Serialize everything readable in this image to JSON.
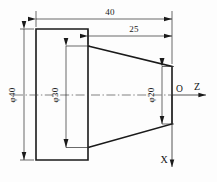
{
  "drawing": {
    "title": "Truncated cone on cylinder - engineering drawing",
    "background_color": "#fdfdfd",
    "line_color": "#1a1a1a",
    "dimensions": {
      "overall_length": {
        "value": "40",
        "name": "overall-length",
        "orientation": "horizontal"
      },
      "cone_length": {
        "value": "25",
        "name": "cone-length",
        "orientation": "horizontal"
      },
      "large_diameter": {
        "value": "φ40",
        "name": "large-diameter",
        "orientation": "vertical"
      },
      "mid_diameter": {
        "value": "φ30",
        "name": "mid-diameter",
        "orientation": "vertical"
      },
      "small_diameter": {
        "value": "φ20",
        "name": "small-diameter",
        "orientation": "vertical"
      }
    },
    "axes": {
      "origin_label": "O",
      "z_axis_label": "Z",
      "x_axis_label": "X"
    }
  }
}
